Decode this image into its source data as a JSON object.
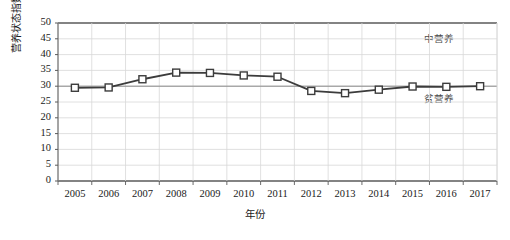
{
  "chart_data": {
    "type": "line",
    "title": "",
    "xlabel": "年份",
    "ylabel": "营养状态指数",
    "x": [
      2005,
      2006,
      2007,
      2008,
      2009,
      2010,
      2011,
      2012,
      2013,
      2014,
      2015,
      2016,
      2017
    ],
    "categories": [
      "2005",
      "2006",
      "2007",
      "2008",
      "2009",
      "2010",
      "2011",
      "2012",
      "2013",
      "2014",
      "2015",
      "2016",
      "2017"
    ],
    "values": [
      29.5,
      29.6,
      32.2,
      34.3,
      34.2,
      33.4,
      33.0,
      28.5,
      27.8,
      28.9,
      29.9,
      29.8,
      30.0
    ],
    "series": [
      {
        "name": "营养状态指数",
        "values": [
          29.5,
          29.6,
          32.2,
          34.3,
          34.2,
          33.4,
          33.0,
          28.5,
          27.8,
          28.9,
          29.9,
          29.8,
          30.0
        ]
      }
    ],
    "ylim": [
      0,
      50
    ],
    "ytick_labels": [
      "0",
      "5",
      "10",
      "15",
      "20",
      "25",
      "30",
      "35",
      "40",
      "45",
      "50"
    ],
    "ytick_values": [
      0,
      5,
      10,
      15,
      20,
      25,
      30,
      35,
      40,
      45,
      50
    ],
    "grid": true,
    "legend": "none",
    "marker": "open-square",
    "line_color": "#3c3c3c",
    "marker_fill": "#ffffff",
    "grid_color": "#d8d8d8",
    "axis_color": "#5a5a5a",
    "annotations": [
      {
        "text": "中营养",
        "x": 2016,
        "y": 45.5,
        "name": "mesotrophic-label"
      },
      {
        "text": "贫营养",
        "x": 2016,
        "y": 26.5,
        "name": "oligotrophic-label"
      }
    ],
    "reference_lines": [
      {
        "value": 30,
        "name": "threshold-line-30"
      }
    ]
  }
}
